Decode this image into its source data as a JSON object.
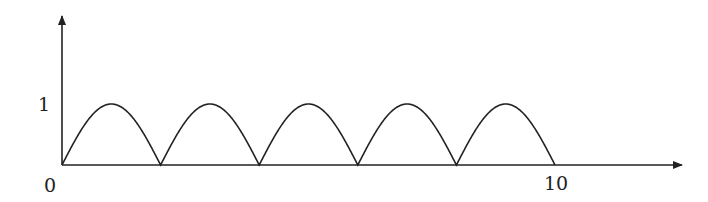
{
  "chart_data": {
    "type": "line",
    "title": "",
    "xlabel": "",
    "ylabel": "",
    "function": "|sin(pi*x/2)|",
    "x_tick_labels": [
      "0",
      "10"
    ],
    "y_tick_labels": [
      "1"
    ],
    "xlim": [
      0,
      12.5
    ],
    "ylim": [
      0,
      2.4
    ],
    "grid": false,
    "legend": null,
    "series": [
      {
        "name": "|sin(πx/2)|",
        "x": [
          0,
          0.5,
          1,
          1.5,
          2,
          2.5,
          3,
          3.5,
          4,
          4.5,
          5,
          5.5,
          6,
          6.5,
          7,
          7.5,
          8,
          8.5,
          9,
          9.5,
          10
        ],
        "values": [
          0,
          0.707,
          1,
          0.707,
          0,
          0.707,
          1,
          0.707,
          0,
          0.707,
          1,
          0.707,
          0,
          0.707,
          1,
          0.707,
          0,
          0.707,
          1,
          0.707,
          0
        ]
      }
    ],
    "zeros": [
      0,
      2,
      4,
      6,
      8,
      10
    ],
    "peaks": [
      1,
      3,
      5,
      7,
      9
    ],
    "peak_value": 1
  },
  "labels": {
    "origin": "0",
    "x_end": "10",
    "y_one": "1"
  },
  "colors": {
    "line": "#222222",
    "axis": "#222222"
  }
}
